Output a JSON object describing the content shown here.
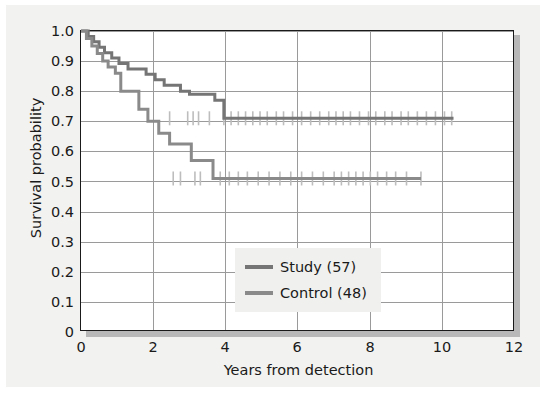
{
  "figure": {
    "background_color": "#f2f2f0",
    "plot_background_color": "#ffffff",
    "border_color": "#1a1a1a",
    "grid_color": "#9a9a9a",
    "shadow_color": "#b8b8b8"
  },
  "chart_data": {
    "type": "line",
    "subtype": "kaplan-meier-survival",
    "title": "",
    "xlabel": "Years from detection",
    "ylabel": "Survival probability",
    "xlim": [
      0,
      12
    ],
    "ylim": [
      0,
      1.0
    ],
    "xticks": [
      "0",
      "2",
      "4",
      "6",
      "8",
      "10",
      "12"
    ],
    "xtick_values": [
      0,
      2,
      4,
      6,
      8,
      10,
      12
    ],
    "yticks": [
      "0",
      "0.1",
      "0.2",
      "0.3",
      "0.4",
      "0.5",
      "0.6",
      "0.7",
      "0.8",
      "0.9",
      "1.0"
    ],
    "ytick_values": [
      0,
      0.1,
      0.2,
      0.3,
      0.4,
      0.5,
      0.6,
      0.7,
      0.8,
      0.9,
      1.0
    ],
    "grid": true,
    "grid_axes": "both",
    "legend_position": "center",
    "series": [
      {
        "name": "Study (57)",
        "label": "Study",
        "n": 57,
        "color": "#757575",
        "steps_x": [
          0.0,
          0.2,
          0.35,
          0.5,
          0.65,
          0.85,
          1.05,
          1.3,
          1.55,
          1.8,
          2.05,
          2.3,
          2.55,
          2.75,
          3.0,
          3.45,
          3.7,
          3.95,
          10.3
        ],
        "steps_y": [
          1.0,
          0.982,
          0.964,
          0.946,
          0.928,
          0.91,
          0.892,
          0.874,
          0.874,
          0.856,
          0.838,
          0.82,
          0.82,
          0.8,
          0.79,
          0.79,
          0.77,
          0.71,
          0.71
        ],
        "plateau_value": 0.71,
        "plateau_start_x": 3.95,
        "end_x": 10.3,
        "censor_x": [
          2.45,
          2.95,
          3.1,
          3.25,
          3.55,
          3.95,
          4.15,
          4.35,
          4.55,
          4.75,
          4.95,
          5.15,
          5.4,
          5.6,
          5.85,
          6.1,
          6.35,
          6.6,
          6.85,
          7.05,
          7.25,
          7.45,
          7.7,
          7.95,
          8.15,
          8.4,
          8.6,
          8.85,
          9.05,
          9.3,
          9.55,
          9.8,
          10.05,
          10.25
        ],
        "censor_y": 0.71
      },
      {
        "name": "Control (48)",
        "label": "Control",
        "n": 48,
        "color": "#8a8a8a",
        "steps_x": [
          0.0,
          0.15,
          0.3,
          0.45,
          0.6,
          0.75,
          0.95,
          1.1,
          1.35,
          1.6,
          1.85,
          2.15,
          2.45,
          2.7,
          3.05,
          3.35,
          3.65,
          9.4
        ],
        "steps_y": [
          1.0,
          0.975,
          0.95,
          0.925,
          0.9,
          0.88,
          0.86,
          0.8,
          0.8,
          0.74,
          0.7,
          0.66,
          0.625,
          0.625,
          0.57,
          0.57,
          0.51,
          0.51
        ],
        "plateau_value": 0.51,
        "plateau_start_x": 3.65,
        "end_x": 9.4,
        "censor_x": [
          2.55,
          2.75,
          3.15,
          3.3,
          3.85,
          4.1,
          4.35,
          4.6,
          4.9,
          5.2,
          5.5,
          5.8,
          6.1,
          6.4,
          6.7,
          7.0,
          7.2,
          7.4,
          7.6,
          7.8,
          8.0,
          8.2,
          8.45,
          8.7,
          9.0,
          9.4
        ],
        "censor_y": 0.51
      }
    ],
    "censor_mark_color": "#bdbdbd",
    "censor_mark_style": "vertical-tick"
  },
  "legend": {
    "items": [
      {
        "label": "Study (57)",
        "color": "#757575"
      },
      {
        "label": "Control (48)",
        "color": "#8a8a8a"
      }
    ]
  }
}
